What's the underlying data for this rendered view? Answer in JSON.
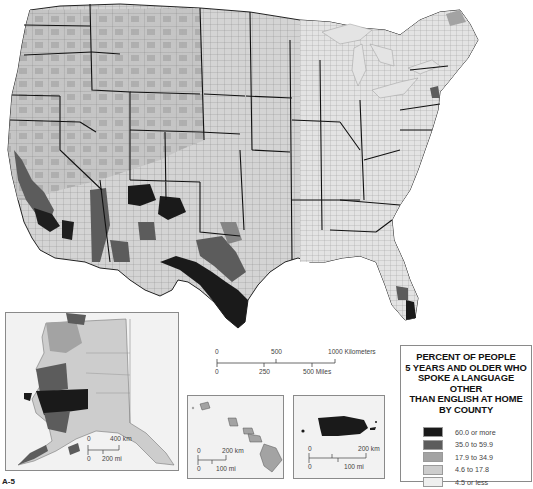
{
  "map": {
    "title": "Percent of People 5 Years and Older Who Spoke a Language Other Than English at Home by County",
    "colors": {
      "water": "#ffffff",
      "lake": "#e6e6e6",
      "county_border": "#7a7a7a",
      "state_border": "#111111",
      "class_1": "#1a1a1a",
      "class_2": "#5c5c5c",
      "class_3": "#a3a3a3",
      "class_4": "#cdcdcd",
      "class_5": "#efefef"
    }
  },
  "legend": {
    "title": "PERCENT OF PEOPLE\n5 YEARS AND OLDER WHO\nSPOKE A LANGUAGE OTHER\nTHAN ENGLISH AT HOME\nBY COUNTY",
    "items": [
      {
        "label": "60.0 or more",
        "color": "#1a1a1a"
      },
      {
        "label": "35.0 to 59.9",
        "color": "#5c5c5c"
      },
      {
        "label": "17.9 to 34.9",
        "color": "#a3a3a3"
      },
      {
        "label": "4.6 to 17.8",
        "color": "#cdcdcd"
      },
      {
        "label": "4.5 or less",
        "color": "#efefef"
      }
    ]
  },
  "main_scale": {
    "km_ticks": [
      "0",
      "500",
      "1000 Kilometers"
    ],
    "mi_ticks": [
      "0",
      "250",
      "500 Miles"
    ]
  },
  "insets": {
    "alaska": {
      "name": "Alaska",
      "km_ticks": [
        "0",
        "400 km"
      ],
      "mi_ticks": [
        "0",
        "200 mi"
      ]
    },
    "hawaii": {
      "name": "Hawaii",
      "km_ticks": [
        "0",
        "200 km"
      ],
      "mi_ticks": [
        "0",
        "100 mi"
      ]
    },
    "puerto_rico": {
      "name": "Puerto Rico",
      "km_ticks": [
        "0",
        "200 km"
      ],
      "mi_ticks": [
        "0",
        "100 mi"
      ]
    }
  },
  "corner_label": "A-5"
}
